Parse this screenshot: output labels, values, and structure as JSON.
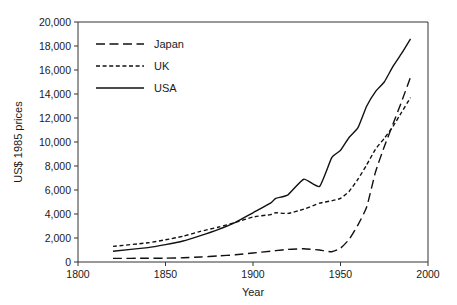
{
  "chart_data": {
    "type": "line",
    "title": "",
    "xlabel": "Year",
    "ylabel": "US$ 1985 prices",
    "xlim": [
      1800,
      2000
    ],
    "ylim": [
      0,
      20000
    ],
    "xticks": [
      1800,
      1850,
      1900,
      1950,
      2000
    ],
    "xtick_labels": [
      "1800",
      "1850",
      "1900",
      "1950",
      "2000"
    ],
    "yticks": [
      0,
      2000,
      4000,
      6000,
      8000,
      10000,
      12000,
      14000,
      16000,
      18000,
      20000
    ],
    "ytick_labels": [
      "0",
      "2,000",
      "4,000",
      "6,000",
      "8,000",
      "10,000",
      "12,000",
      "14,000",
      "16,000",
      "18,000",
      "20,000"
    ],
    "grid": false,
    "legend_position": "upper-left",
    "series": [
      {
        "name": "Japan",
        "linestyle": "long-dash",
        "color": "#111111",
        "x": [
          1820,
          1840,
          1850,
          1860,
          1870,
          1880,
          1890,
          1900,
          1910,
          1913,
          1920,
          1929,
          1938,
          1940,
          1945,
          1950,
          1955,
          1960,
          1965,
          1970,
          1975,
          1980,
          1985,
          1990
        ],
        "y": [
          300,
          310,
          320,
          350,
          420,
          500,
          600,
          750,
          900,
          950,
          1050,
          1100,
          1000,
          950,
          850,
          1150,
          1900,
          3100,
          4600,
          7500,
          9600,
          11500,
          13400,
          15400
        ]
      },
      {
        "name": "UK",
        "linestyle": "short-dash",
        "color": "#111111",
        "x": [
          1820,
          1840,
          1850,
          1860,
          1870,
          1880,
          1890,
          1900,
          1910,
          1913,
          1920,
          1929,
          1938,
          1945,
          1950,
          1955,
          1960,
          1965,
          1970,
          1975,
          1980,
          1985,
          1990
        ],
        "y": [
          1300,
          1600,
          1850,
          2150,
          2550,
          2900,
          3300,
          3750,
          3950,
          4100,
          4050,
          4400,
          4900,
          5100,
          5300,
          5900,
          6900,
          8100,
          9400,
          10300,
          11300,
          12500,
          13700
        ]
      },
      {
        "name": "USA",
        "linestyle": "solid",
        "color": "#111111",
        "x": [
          1820,
          1840,
          1850,
          1860,
          1870,
          1880,
          1890,
          1900,
          1910,
          1913,
          1920,
          1929,
          1938,
          1945,
          1950,
          1955,
          1960,
          1965,
          1970,
          1975,
          1980,
          1985,
          1990
        ],
        "y": [
          900,
          1200,
          1450,
          1750,
          2200,
          2700,
          3300,
          4100,
          4900,
          5300,
          5600,
          6900,
          6300,
          8700,
          9300,
          10400,
          11200,
          13000,
          14200,
          15000,
          16300,
          17400,
          18600
        ]
      }
    ]
  },
  "legend": {
    "entries": [
      {
        "label": "Japan"
      },
      {
        "label": "UK"
      },
      {
        "label": "USA"
      }
    ]
  }
}
